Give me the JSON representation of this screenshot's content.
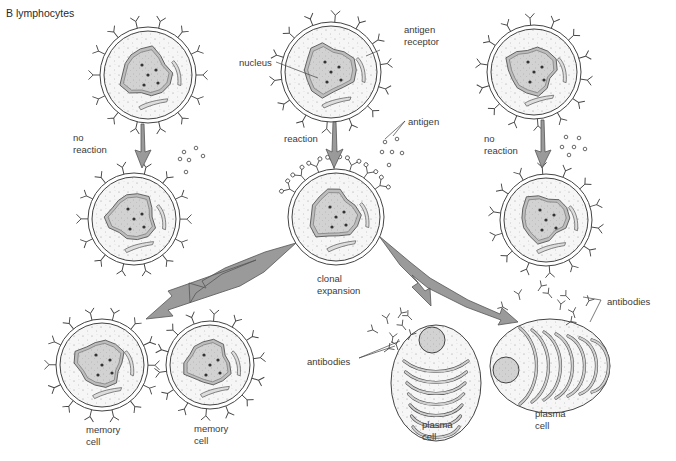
{
  "title": "B lymphocytes",
  "labels": {
    "no_reaction_left": "no\nreaction",
    "no_reaction_right": "no\nreaction",
    "reaction": "reaction",
    "nucleus": "nucleus",
    "antigen_receptor": "antigen\nreceptor",
    "antigen": "antigen",
    "clonal_expansion": "clonal\nexpansion",
    "memory_cell_1": "memory\ncell",
    "memory_cell_2": "memory\ncell",
    "plasma_cell_1": "plasma\ncell",
    "plasma_cell_2": "plasma\ncell",
    "antibodies_left": "antibodies",
    "antibodies_right": "antibodies"
  },
  "colors": {
    "arrow_fill": "#9a9a9a",
    "arrow_stroke": "#555555",
    "nucleus_fill": "#cfcfcf",
    "cytoplasm_fill": "#f4f4f4",
    "outline": "#444444"
  },
  "cells": [
    {
      "id": "lymphocyte-left",
      "type": "B lymphocyte",
      "cx": 148,
      "cy": 75,
      "r": 48
    },
    {
      "id": "lymphocyte-center",
      "type": "B lymphocyte",
      "cx": 331,
      "cy": 72,
      "r": 50
    },
    {
      "id": "lymphocyte-right",
      "type": "B lymphocyte",
      "cx": 534,
      "cy": 72,
      "r": 47
    },
    {
      "id": "no-reaction-left-cell",
      "type": "B lymphocyte",
      "cx": 134,
      "cy": 219,
      "r": 46
    },
    {
      "id": "activated-cell",
      "type": "B lymphocyte with bound antigen",
      "cx": 336,
      "cy": 217,
      "r": 48
    },
    {
      "id": "no-reaction-right-cell",
      "type": "B lymphocyte",
      "cx": 546,
      "cy": 220,
      "r": 46
    },
    {
      "id": "memory-cell-1",
      "type": "memory cell",
      "cx": 102,
      "cy": 365,
      "r": 46
    },
    {
      "id": "memory-cell-2",
      "type": "memory cell",
      "cx": 210,
      "cy": 365,
      "r": 44
    },
    {
      "id": "plasma-cell-1",
      "type": "plasma cell",
      "cx": 436,
      "cy": 383
    },
    {
      "id": "plasma-cell-2",
      "type": "plasma cell",
      "cx": 550,
      "cy": 366
    }
  ]
}
